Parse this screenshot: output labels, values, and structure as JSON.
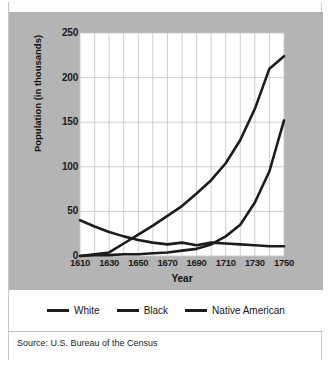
{
  "figure": {
    "source_note": "Source: U.S. Bureau of the Census"
  },
  "chart_data": {
    "type": "line",
    "title": "",
    "xlabel": "Year",
    "ylabel": "Population (in thousands)",
    "xlim": [
      1610,
      1750
    ],
    "ylim": [
      0,
      250
    ],
    "grid": true,
    "x_major_ticks": [
      1610,
      1630,
      1650,
      1670,
      1690,
      1710,
      1730,
      1750
    ],
    "x_minor_step": 10,
    "y_ticks": [
      0,
      50,
      100,
      150,
      200,
      250
    ],
    "legend_position": "bottom",
    "x": [
      1610,
      1620,
      1630,
      1640,
      1650,
      1660,
      1670,
      1680,
      1690,
      1700,
      1710,
      1720,
      1730,
      1740,
      1750
    ],
    "series": [
      {
        "name": "White",
        "color": "#1c1c1c",
        "values": [
          0,
          2,
          4,
          14,
          24,
          34,
          45,
          56,
          70,
          85,
          104,
          130,
          165,
          210,
          224
        ]
      },
      {
        "name": "Black",
        "color": "#1c1c1c",
        "values": [
          0,
          1,
          1,
          2,
          2,
          3,
          4,
          6,
          8,
          13,
          22,
          35,
          60,
          95,
          152
        ]
      },
      {
        "name": "Native American",
        "color": "#1c1c1c",
        "values": [
          40,
          33,
          27,
          22,
          18,
          15,
          13,
          15,
          12,
          15,
          14,
          13,
          12,
          11,
          11
        ]
      }
    ]
  }
}
